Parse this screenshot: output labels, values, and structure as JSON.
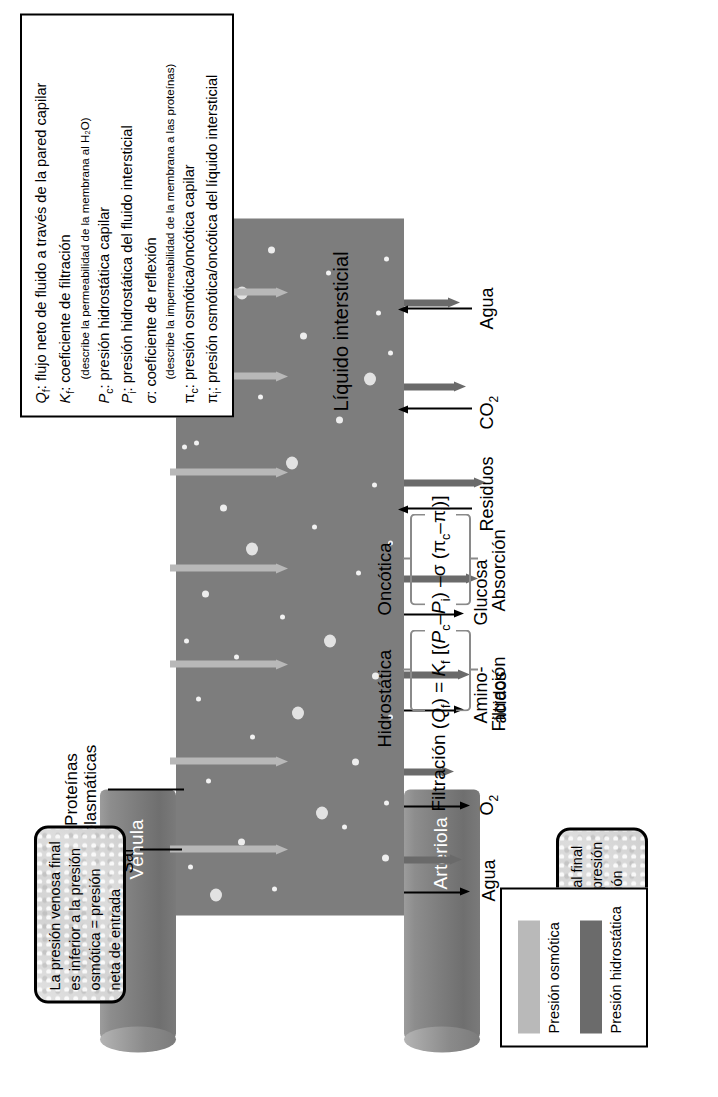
{
  "figure": {
    "title_implicit": "Intercambio capilar — fuerzas de Starling"
  },
  "vessels": {
    "arteriole": "Arteriola",
    "venule": "Vénula"
  },
  "callouts": {
    "arterial": "La presión arterial final es superior a la presión osmótica = presión neta de salida",
    "venous": "La presión venosa final es inferior a la presión osmótica = presión neta de entrada"
  },
  "equation": {
    "lhs": "Filtración (",
    "qf": "Q",
    "qf_sub": "f",
    "eq": ") = ",
    "kf": "K",
    "kf_sub": "f",
    "open": " [(",
    "pc": "P",
    "pc_sub": "c",
    "minus1": "–",
    "pi_": "P",
    "pi_sub": "i",
    "close1": ") ",
    "minus2": "–",
    "sigma": "σ",
    "open2": " (π",
    "pic_sub": "c",
    "minus3": "–",
    "pii": "π",
    "pii_sub": "i",
    "close2": ")]",
    "full_text": "Filtración (Qf) = Kf [(Pc–Pi) –σ (πc–πi)]",
    "term_labels": {
      "hydrostatic": "Hidrostática",
      "oncotic": "Oncótica",
      "filtration": "Filtración",
      "absorption": "Absorción"
    }
  },
  "key_box": {
    "items": [
      {
        "label": "Presión osmótica",
        "color": "#b9b9b9"
      },
      {
        "label": "Presión hidrostática",
        "color": "#6b6b6b"
      }
    ]
  },
  "interstitial_label": "Líquido intersticial",
  "definitions": [
    {
      "sym": "Q",
      "sub": "f",
      "text": ": flujo neto de fluido a través de la pared capilar",
      "note": null
    },
    {
      "sym": "K",
      "sub": "f",
      "text": ": coeficiente de filtración",
      "note": "(describe la permeabilidad de la membrana al H₂O)"
    },
    {
      "sym": "P",
      "sub": "c",
      "text": ": presión hidrostática capilar",
      "note": null
    },
    {
      "sym": "P",
      "sub": "i",
      "text": ": presión hidrostática del fluido intersticial",
      "note": null
    },
    {
      "sym": "σ",
      "sub": "",
      "text": ": coeficiente de reflexión",
      "note": "(describe la impermeabilidad de la membrana a las proteínas)"
    },
    {
      "sym": "π",
      "sub": "c",
      "text": ": presión osmótica/oncótica capilar",
      "note": null
    },
    {
      "sym": "π",
      "sub": "i",
      "text": ": presión osmótica/oncótica del líquido intersticial",
      "note": null
    }
  ],
  "capillary_content_labels": {
    "plasma_proteins_line1": "Proteínas",
    "plasma_proteins_line2": "plasmáticas",
    "salt": "Sal"
  },
  "solutes": [
    {
      "name": "Agua",
      "direction": "out",
      "line2": ""
    },
    {
      "name": "O",
      "sub": "2",
      "direction": "out",
      "line2": ""
    },
    {
      "name": "Amino-",
      "line2": "ácidos",
      "direction": "out"
    },
    {
      "name": "Glucosa",
      "direction": "out",
      "line2": ""
    },
    {
      "name": "Residuos",
      "direction": "in",
      "line2": ""
    },
    {
      "name": "CO",
      "sub": "2",
      "direction": "in",
      "line2": ""
    },
    {
      "name": "Agua",
      "direction": "in",
      "line2": ""
    }
  ],
  "colors": {
    "osmotic_arrow": "#b8b8b8",
    "hydrostatic_arrow": "#6a6a6a",
    "capillary_fill": "#7d7d7d",
    "vessel_fill": "#7e7e7e",
    "dot_fill": "#e8e8e8",
    "outline": "#000000"
  }
}
